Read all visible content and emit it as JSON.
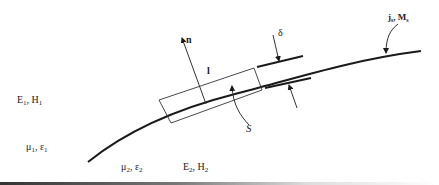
{
  "diagram": {
    "labels": {
      "normal": "n",
      "contour": "l",
      "surface": "S",
      "thickness": "δ",
      "surface_sources": "j",
      "surface_sources_sub": "s",
      "surface_sources_sep": ", ",
      "surface_sources_m": "M",
      "surface_sources_m_sub": "s",
      "region1_fields_E": "E",
      "region1_fields_sub": "1",
      "region1_fields_H": "H",
      "region1_media_mu": "μ",
      "region1_media_eps": "ε",
      "region2_fields_E": "E",
      "region2_fields_sub": "2",
      "region2_fields_H": "H",
      "region2_media_mu": "μ",
      "region2_media_eps": "ε"
    },
    "colors": {
      "line": "#1a1a1a",
      "background": "#ffffff"
    }
  }
}
